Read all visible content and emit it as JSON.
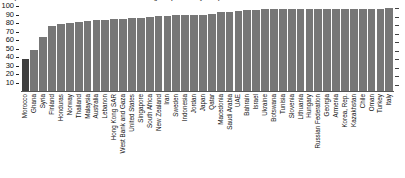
{
  "chart": {
    "title_clipped": "(Percent of students who reached or exceeded a given proficiency level)",
    "y_axis": {
      "ticks": [
        10,
        20,
        30,
        40,
        50,
        60,
        70,
        80,
        90,
        100
      ],
      "min": 0,
      "max": 100
    }
  },
  "chart_data": {
    "type": "bar",
    "title": "(Percent of students who reached or exceeded a given proficiency level)",
    "xlabel": "",
    "ylabel": "",
    "ylim": [
      0,
      100
    ],
    "grid": false,
    "legend": "none",
    "categories": [
      "Morocco",
      "Ghana",
      "Syria",
      "Finland",
      "Honduras",
      "Norway",
      "Thailand",
      "Malaysia",
      "Australia",
      "Lebanon",
      "Hong Kong SAR",
      "West Bank and Gaza",
      "United States",
      "Singapore",
      "South Africa",
      "New Zealand",
      "Iran",
      "Sweden",
      "Indonesia",
      "Jordan",
      "Japan",
      "Qatar",
      "Macedonia",
      "Saudi Arabia",
      "UAE",
      "Bahrain",
      "Israel",
      "Ukraine",
      "Botswana",
      "Tunisia",
      "Slovenia",
      "Lithuania",
      "Hungary",
      "Russian Federation",
      "Georgia",
      "Armenia",
      "Korea, Rep.",
      "Kazakhstan",
      "Chile",
      "Oman",
      "Turkey",
      "Italy"
    ],
    "values": [
      38,
      48,
      63,
      77,
      79,
      80,
      81,
      82,
      83,
      84,
      85,
      85,
      86,
      86,
      87,
      88,
      88,
      89,
      89,
      90,
      90,
      91,
      93,
      93,
      94,
      95,
      95,
      96,
      96,
      96,
      96,
      96,
      97,
      97,
      97,
      97,
      97,
      97,
      97,
      97,
      97,
      98
    ],
    "bar_color": "#777777",
    "highlight_color": "#3f3f3f",
    "highlight_index": 0
  }
}
